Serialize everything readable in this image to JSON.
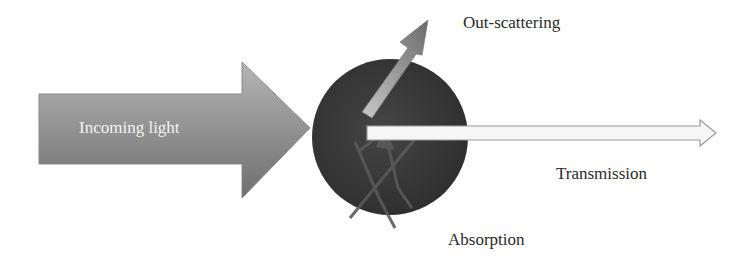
{
  "diagram": {
    "labels": {
      "incoming": "Incoming light",
      "out_scattering": "Out-scattering",
      "transmission": "Transmission",
      "absorption": "Absorption"
    },
    "colors": {
      "background": "#ffffff",
      "particle": "#3d3d3d",
      "incoming_light": "#8a8a8a",
      "scatter_arrow": "#9a9a9a",
      "transmission_fill": "#f4f4f4",
      "transmission_stroke": "#a0a0a0",
      "absorption_arrow": "#6a6a6a",
      "text": "#2a2a2a"
    }
  }
}
